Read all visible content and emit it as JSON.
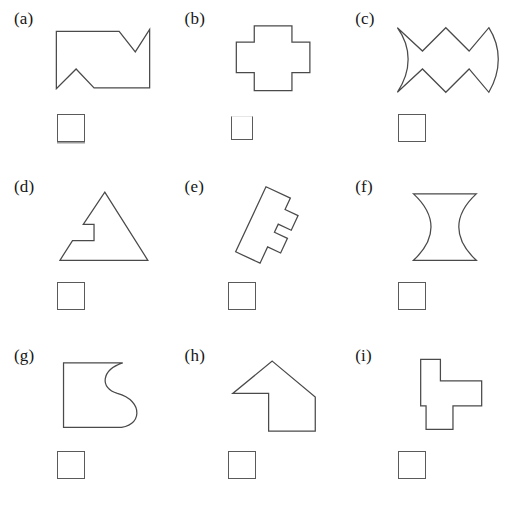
{
  "page": {
    "background_color": "#ffffff",
    "stroke_color": "#4a4a4a",
    "box_stroke_color": "#5a5a5a",
    "width": 512,
    "height": 505,
    "columns": 3,
    "rows": 3
  },
  "panels": [
    {
      "label": "(a)",
      "shape_name": "notched-rectangle-zigzag",
      "shape_description": "Rectangle outline with a V notch cut into the top right edge and a V notch rising from the bottom left edge",
      "geometry_type": "polygon",
      "path": "M 16 16 L 86 16 L 104 39 L 120 14 L 120 79 L 58 79 L 38 58 L 16 80 Z",
      "viewbox": "0 0 136 96",
      "answer_box": {
        "present": true,
        "size": "size-std",
        "shadow": true,
        "filled": false,
        "value": ""
      }
    },
    {
      "label": "(b)",
      "shape_name": "plus-cross",
      "shape_description": "Symmetric plus or cross shape made of right angles",
      "geometry_type": "polygon",
      "path": "M 46 10 L 88 10 L 88 28 L 108 28 L 108 62 L 88 62 L 88 82 L 46 82 L 46 62 L 26 62 L 26 28 L 46 28 Z",
      "viewbox": "0 0 136 96",
      "answer_box": {
        "present": true,
        "size": "size-small",
        "shadow": false,
        "filled": false,
        "value": ""
      }
    },
    {
      "label": "(c)",
      "shape_name": "zigzag-fish-curved-ends",
      "shape_description": "Zigzag band with a concave curved left edge and a convex curved right edge, resembling a fish or bowtie",
      "geometry_type": "path-with-arcs",
      "path": "M 16 12 C 32 34 32 60 16 84 L 44 58 L 70 84 L 96 58 L 118 84 C 132 60 132 34 118 12 L 96 38 L 70 12 L 44 38 Z",
      "viewbox": "0 0 136 96",
      "answer_box": {
        "present": true,
        "size": "size-std",
        "shadow": false,
        "filled": false,
        "value": ""
      }
    },
    {
      "label": "(d)",
      "shape_name": "triangle-with-step-notch",
      "shape_description": "Triangle with a rectangular staircase notch cut into its lower left flank",
      "geometry_type": "polygon",
      "path": "M 70 8 L 118 84 L 20 84 L 34 62 L 58 62 L 58 44 L 46 44 Z",
      "viewbox": "0 0 136 96",
      "answer_box": {
        "present": true,
        "size": "size-std",
        "shadow": false,
        "filled": false,
        "value": ""
      }
    },
    {
      "label": "(e)",
      "shape_name": "rotated-comb-e-shape",
      "shape_description": "Rectilinear E or comb shaped polygon rotated about twenty five degrees clockwise",
      "geometry_type": "polygon-rotated",
      "path": "M 40 8 L 70 8 L 70 22 L 86 22 L 86 40 L 70 40 L 70 50 L 86 50 L 86 68 L 70 68 L 70 88 L 40 88 Z",
      "rotation_deg": 25,
      "rotation_origin": "63 48",
      "viewbox": "0 0 136 96",
      "answer_box": {
        "present": true,
        "size": "size-std",
        "shadow": false,
        "filled": false,
        "value": ""
      }
    },
    {
      "label": "(f)",
      "shape_name": "hourglass-concave-sides",
      "shape_description": "Hourglass with straight horizontal top and bottom edges and two inward curving concave side edges",
      "geometry_type": "path-with-arcs",
      "path": "M 34 10 L 104 10 C 78 34 78 60 104 84 L 34 84 C 60 60 60 34 34 10 Z",
      "viewbox": "0 0 136 96",
      "answer_box": {
        "present": true,
        "size": "size-std",
        "shadow": false,
        "filled": false,
        "value": ""
      }
    },
    {
      "label": "(g)",
      "shape_name": "piano-s-curve",
      "shape_description": "Shape with straight left top and bottom edges and an S curve forming the right edge, like a grand piano outline",
      "geometry_type": "path-with-arcs",
      "path": "M 24 10 L 90 10 C 66 18 64 38 84 44 C 114 52 112 82 84 82 L 24 82 Z",
      "viewbox": "0 0 136 96",
      "answer_box": {
        "present": true,
        "size": "size-std",
        "shadow": false,
        "filled": false,
        "value": ""
      }
    },
    {
      "label": "(h)",
      "shape_name": "arrow-house-up-left",
      "shape_description": "Arrow or house like shape with a peaked roof pointing up and a rectangular body offset to the right",
      "geometry_type": "polygon",
      "path": "M 66 8 L 114 48 L 114 86 L 62 86 L 62 44 L 22 44 Z",
      "viewbox": "0 0 136 96",
      "answer_box": {
        "present": true,
        "size": "size-std",
        "shadow": false,
        "filled": false,
        "value": ""
      }
    },
    {
      "label": "(i)",
      "shape_name": "rectilinear-polyomino",
      "shape_description": "Rectilinear polyomino with a tall left column, a wide arm extending right, and a small foot at the bottom",
      "geometry_type": "polygon",
      "path": "M 42 6 L 64 6 L 64 30 L 110 30 L 110 58 L 78 58 L 78 84 L 48 84 L 48 58 L 42 58 Z",
      "viewbox": "0 0 136 96",
      "answer_box": {
        "present": true,
        "size": "size-std",
        "shadow": false,
        "filled": false,
        "value": ""
      }
    }
  ]
}
